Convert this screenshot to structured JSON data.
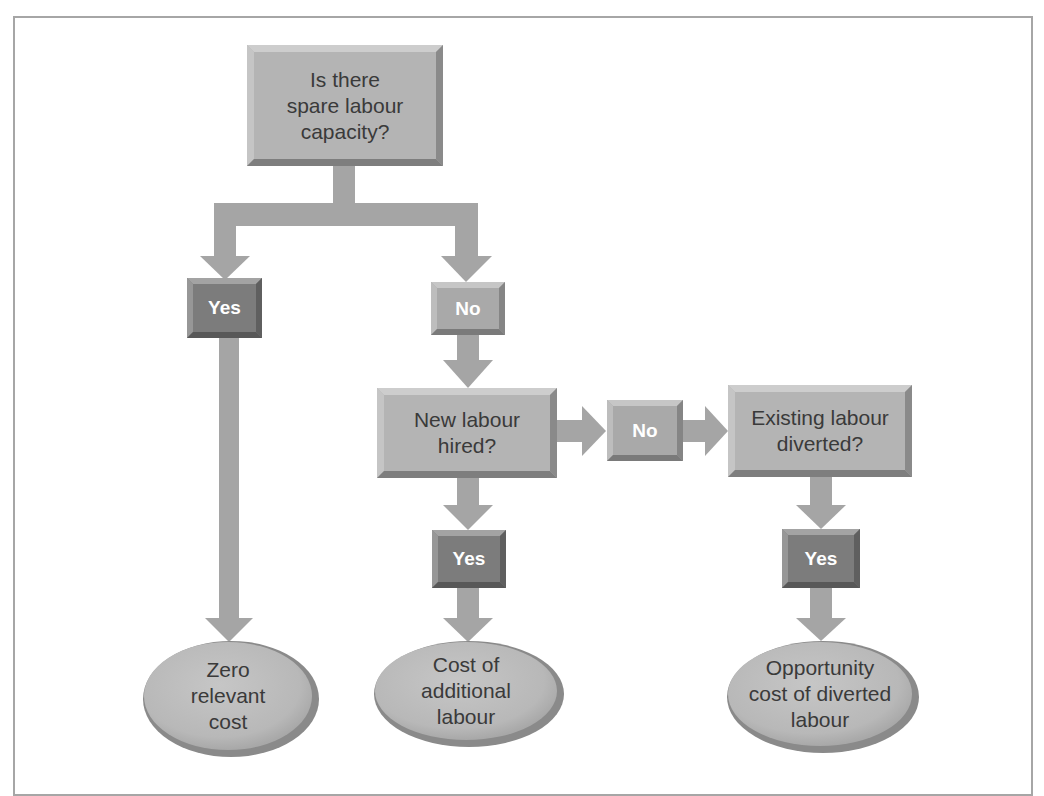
{
  "diagram": {
    "type": "flowchart",
    "colors": {
      "box_fill": "#b4b4b4",
      "box_light_edge": "#cfcfcf",
      "box_dark_edge": "#7e7e7e",
      "yes_fill": "#7c7c7c",
      "no_fill": "#a9a9a9",
      "arrow": "#a5a5a5",
      "ellipse_fill": "#bdbdbd",
      "ellipse_rim": "#8a8a8a",
      "text": "#3a3a3a",
      "frame": "#a6a6a6"
    },
    "nodes": {
      "start": {
        "label": "Is there spare labour capacity?",
        "lines": [
          "Is there",
          "spare labour",
          "capacity?"
        ]
      },
      "yes_1": {
        "label": "Yes"
      },
      "no_1": {
        "label": "No"
      },
      "new_labour": {
        "label": "New labour hired?",
        "lines": [
          "New labour",
          "hired?"
        ]
      },
      "no_2": {
        "label": "No"
      },
      "existing_labour": {
        "label": "Existing labour diverted?",
        "lines": [
          "Existing labour",
          "diverted?"
        ]
      },
      "yes_2": {
        "label": "Yes"
      },
      "yes_3": {
        "label": "Yes"
      },
      "end_zero": {
        "label": "Zero relevant cost",
        "lines": [
          "Zero",
          "relevant",
          "cost"
        ]
      },
      "end_additional": {
        "label": "Cost of additional labour",
        "lines": [
          "Cost of",
          "additional",
          "labour"
        ]
      },
      "end_opportunity": {
        "label": "Opportunity cost of diverted labour",
        "lines": [
          "Opportunity",
          "cost of diverted",
          "labour"
        ]
      }
    },
    "edges": [
      {
        "from": "start",
        "to": "yes_1"
      },
      {
        "from": "start",
        "to": "no_1"
      },
      {
        "from": "yes_1",
        "to": "end_zero"
      },
      {
        "from": "no_1",
        "to": "new_labour"
      },
      {
        "from": "new_labour",
        "to": "no_2"
      },
      {
        "from": "no_2",
        "to": "existing_labour"
      },
      {
        "from": "new_labour",
        "to": "yes_2"
      },
      {
        "from": "yes_2",
        "to": "end_additional"
      },
      {
        "from": "existing_labour",
        "to": "yes_3"
      },
      {
        "from": "yes_3",
        "to": "end_opportunity"
      }
    ]
  }
}
